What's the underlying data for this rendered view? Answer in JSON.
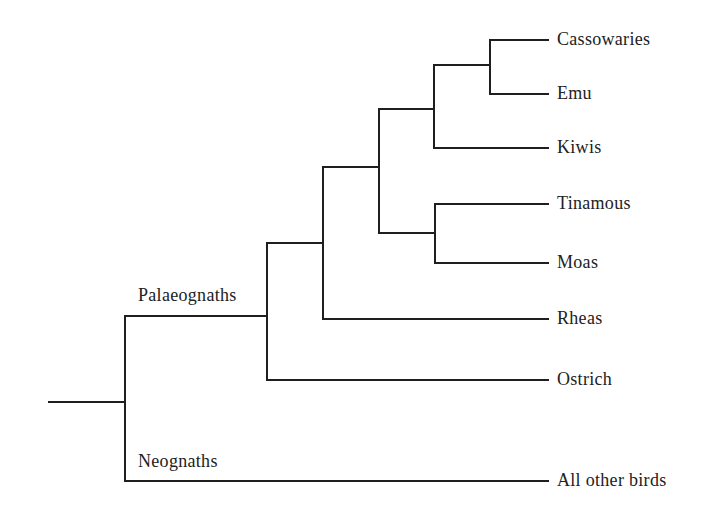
{
  "diagram": {
    "type": "phylogenetic-tree",
    "line_color": "#1f1f1f",
    "text_color": "#222222"
  },
  "clades": [
    {
      "id": "palaeognaths",
      "label": "Palaeognaths",
      "x": 138,
      "y": 286
    },
    {
      "id": "neognaths",
      "label": "Neognaths",
      "x": 138,
      "y": 452
    }
  ],
  "taxa": [
    {
      "id": "cassowaries",
      "label": "Cassowaries",
      "y": 40
    },
    {
      "id": "emu",
      "label": "Emu",
      "y": 94
    },
    {
      "id": "kiwis",
      "label": "Kiwis",
      "y": 148
    },
    {
      "id": "tinamous",
      "label": "Tinamous",
      "y": 204
    },
    {
      "id": "moas",
      "label": "Moas",
      "y": 263
    },
    {
      "id": "rheas",
      "label": "Rheas",
      "y": 319
    },
    {
      "id": "ostrich",
      "label": "Ostrich",
      "y": 380
    },
    {
      "id": "all-other-birds",
      "label": "All other birds",
      "y": 481
    }
  ],
  "tip_x": 548,
  "label_x": 557,
  "branches": [
    {
      "name": "root-stem",
      "points": [
        [
          49,
          402
        ],
        [
          125,
          402
        ]
      ]
    },
    {
      "name": "root-node",
      "points": [
        [
          125,
          316
        ],
        [
          125,
          481
        ]
      ]
    },
    {
      "name": "neognaths-branch",
      "points": [
        [
          125,
          481
        ],
        [
          548,
          481
        ]
      ]
    },
    {
      "name": "palaeognaths-branch",
      "points": [
        [
          125,
          316
        ],
        [
          267,
          316
        ]
      ]
    },
    {
      "name": "palaeognath-node",
      "points": [
        [
          267,
          243
        ],
        [
          267,
          380
        ]
      ]
    },
    {
      "name": "ostrich-branch",
      "points": [
        [
          267,
          380
        ],
        [
          548,
          380
        ]
      ]
    },
    {
      "name": "ostrich-sister-branch",
      "points": [
        [
          267,
          243
        ],
        [
          323,
          243
        ]
      ]
    },
    {
      "name": "rheas-node",
      "points": [
        [
          323,
          167
        ],
        [
          323,
          319
        ]
      ]
    },
    {
      "name": "rheas-branch",
      "points": [
        [
          323,
          319
        ],
        [
          548,
          319
        ]
      ]
    },
    {
      "name": "rheas-sister-branch",
      "points": [
        [
          323,
          167
        ],
        [
          379,
          167
        ]
      ]
    },
    {
      "name": "notopalaeognath-node",
      "points": [
        [
          379,
          109
        ],
        [
          379,
          233
        ]
      ]
    },
    {
      "name": "casuariiform-kiwi-branch",
      "points": [
        [
          379,
          109
        ],
        [
          434,
          109
        ]
      ]
    },
    {
      "name": "kiwi-node",
      "points": [
        [
          434,
          65
        ],
        [
          434,
          148
        ]
      ]
    },
    {
      "name": "kiwis-branch",
      "points": [
        [
          434,
          148
        ],
        [
          548,
          148
        ]
      ]
    },
    {
      "name": "casuariiform-branch",
      "points": [
        [
          434,
          65
        ],
        [
          490,
          65
        ]
      ]
    },
    {
      "name": "casuariiform-node",
      "points": [
        [
          490,
          40
        ],
        [
          490,
          94
        ]
      ]
    },
    {
      "name": "cassowaries-branch",
      "points": [
        [
          490,
          40
        ],
        [
          548,
          40
        ]
      ]
    },
    {
      "name": "emu-branch",
      "points": [
        [
          490,
          94
        ],
        [
          548,
          94
        ]
      ]
    },
    {
      "name": "tinamou-moa-branch",
      "points": [
        [
          379,
          233
        ],
        [
          435,
          233
        ]
      ]
    },
    {
      "name": "tinamou-moa-node",
      "points": [
        [
          435,
          204
        ],
        [
          435,
          263
        ]
      ]
    },
    {
      "name": "tinamous-branch",
      "points": [
        [
          435,
          204
        ],
        [
          548,
          204
        ]
      ]
    },
    {
      "name": "moas-branch",
      "points": [
        [
          435,
          263
        ],
        [
          548,
          263
        ]
      ]
    }
  ]
}
